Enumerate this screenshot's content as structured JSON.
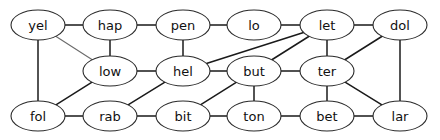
{
  "diagram": {
    "node_fill": "#ffffff",
    "node_stroke": "#2b2b2b",
    "edge_color": "#1a1a1a",
    "edge_color_light": "#6b6b6b",
    "background": "#ffffff",
    "node_rx": 27,
    "node_ry": 15,
    "nodes": [
      {
        "id": "yel",
        "label": "yel",
        "x": 38,
        "y": 25
      },
      {
        "id": "hap",
        "label": "hap",
        "x": 110,
        "y": 25
      },
      {
        "id": "pen",
        "label": "pen",
        "x": 183,
        "y": 25
      },
      {
        "id": "lo",
        "label": "lo",
        "x": 254,
        "y": 25
      },
      {
        "id": "let",
        "label": "let",
        "x": 327,
        "y": 25
      },
      {
        "id": "dol",
        "label": "dol",
        "x": 400,
        "y": 25
      },
      {
        "id": "low",
        "label": "low",
        "x": 110,
        "y": 71
      },
      {
        "id": "hel",
        "label": "hel",
        "x": 183,
        "y": 71
      },
      {
        "id": "but",
        "label": "but",
        "x": 254,
        "y": 71
      },
      {
        "id": "ter",
        "label": "ter",
        "x": 327,
        "y": 71
      },
      {
        "id": "fol",
        "label": "fol",
        "x": 38,
        "y": 116
      },
      {
        "id": "rab",
        "label": "rab",
        "x": 110,
        "y": 116
      },
      {
        "id": "bit",
        "label": "bit",
        "x": 183,
        "y": 116
      },
      {
        "id": "ton",
        "label": "ton",
        "x": 254,
        "y": 116
      },
      {
        "id": "bet",
        "label": "bet",
        "x": 327,
        "y": 116
      },
      {
        "id": "lar",
        "label": "lar",
        "x": 400,
        "y": 116
      }
    ],
    "edges": [
      {
        "source": "yel",
        "target": "hap",
        "weight": "normal"
      },
      {
        "source": "hap",
        "target": "pen",
        "weight": "normal"
      },
      {
        "source": "pen",
        "target": "lo",
        "weight": "normal"
      },
      {
        "source": "lo",
        "target": "let",
        "weight": "normal"
      },
      {
        "source": "let",
        "target": "dol",
        "weight": "normal"
      },
      {
        "source": "low",
        "target": "hel",
        "weight": "normal"
      },
      {
        "source": "hel",
        "target": "but",
        "weight": "normal"
      },
      {
        "source": "but",
        "target": "ter",
        "weight": "normal"
      },
      {
        "source": "fol",
        "target": "rab",
        "weight": "normal"
      },
      {
        "source": "rab",
        "target": "bit",
        "weight": "normal"
      },
      {
        "source": "bit",
        "target": "ton",
        "weight": "normal"
      },
      {
        "source": "ton",
        "target": "bet",
        "weight": "normal"
      },
      {
        "source": "bet",
        "target": "lar",
        "weight": "normal"
      },
      {
        "source": "yel",
        "target": "fol",
        "weight": "normal"
      },
      {
        "source": "yel",
        "target": "low",
        "weight": "light"
      },
      {
        "source": "hap",
        "target": "low",
        "weight": "normal"
      },
      {
        "source": "low",
        "target": "fol",
        "weight": "normal"
      },
      {
        "source": "pen",
        "target": "hel",
        "weight": "normal"
      },
      {
        "source": "hel",
        "target": "rab",
        "weight": "normal"
      },
      {
        "source": "hel",
        "target": "let",
        "weight": "normal"
      },
      {
        "source": "but",
        "target": "let",
        "weight": "normal"
      },
      {
        "source": "but",
        "target": "bit",
        "weight": "normal"
      },
      {
        "source": "but",
        "target": "ton",
        "weight": "normal"
      },
      {
        "source": "let",
        "target": "ter",
        "weight": "normal"
      },
      {
        "source": "dol",
        "target": "ter",
        "weight": "normal"
      },
      {
        "source": "dol",
        "target": "lar",
        "weight": "normal"
      },
      {
        "source": "ter",
        "target": "bet",
        "weight": "normal"
      },
      {
        "source": "ter",
        "target": "lar",
        "weight": "normal"
      }
    ]
  }
}
